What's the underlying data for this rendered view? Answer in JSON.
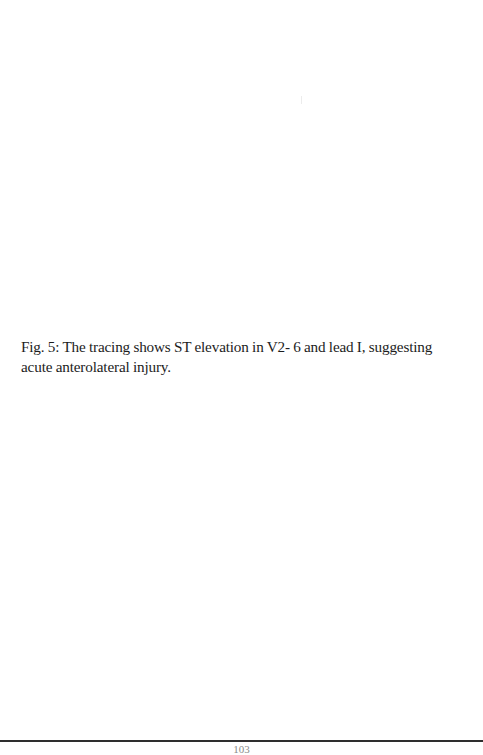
{
  "document": {
    "figure": {
      "label": "Fig. 5:",
      "caption_text": "The tracing shows ST elevation in V2- 6 and lead I, suggesting acute anterolateral injury."
    },
    "footer": {
      "page_number": "103"
    }
  }
}
